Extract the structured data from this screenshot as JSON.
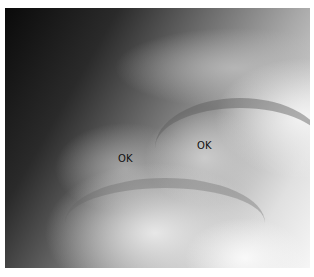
{
  "image": {
    "description": "Grayscale X-ray of a joint showing two ossification centers",
    "labels": [
      {
        "text": "OK",
        "x": 118,
        "y": 153
      },
      {
        "text": "OK",
        "x": 197,
        "y": 140
      }
    ]
  }
}
